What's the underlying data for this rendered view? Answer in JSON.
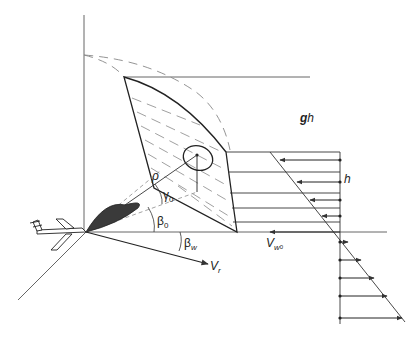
{
  "figure": {
    "type": "radar-geometry-wind-shear-diagram",
    "colors": {
      "line": "#333333",
      "dashed": "#888888",
      "beam": "#3a3a3a",
      "background": "#ffffff"
    }
  },
  "labels": {
    "rho": "ρ",
    "gamma0": "γ",
    "gamma0_sub": "0",
    "beta0": "β",
    "beta0_sub": "0",
    "betaw": "β",
    "betaw_sub": "w",
    "vr": "V",
    "vr_sub": "r",
    "vw0": "V",
    "vw0_sub": "w",
    "vw0_subsub": "0",
    "gh_g": "g",
    "gh_h": "h",
    "h": "h"
  },
  "elements": {
    "aircraft": "aircraft-icon",
    "antenna_beam": "antenna-beam-lobe",
    "illuminated_surface": "hatched-surface-patch",
    "resolution_cell": "ellipse-cell",
    "wind_profile_upper_arrows": 4,
    "wind_profile_lower_arrows": 5
  }
}
